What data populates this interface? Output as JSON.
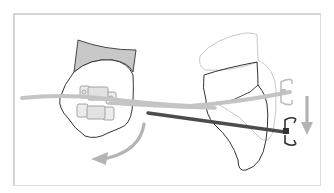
{
  "figure": {
    "panels": [
      {
        "name": "front-view",
        "elements": [
          "tooth-crown",
          "gingiva-band",
          "bracket",
          "archwire",
          "rotation-arrow"
        ]
      },
      {
        "name": "side-view",
        "elements": [
          "tooth-original-outline",
          "tooth-moved-outline",
          "wire-light",
          "wire-dark",
          "bracket-hook-light",
          "bracket-hook-dark",
          "down-arrow"
        ]
      }
    ],
    "colors": {
      "frame": "#d3d3d3",
      "outline": "#333333",
      "gingiva": "#c8c8c8",
      "wire_light": "#c4c4c4",
      "wire_dark": "#555555",
      "ghost_outline": "#c8c8c8",
      "arrow": "#b4b4b4",
      "bracket_fill": "#e6e6e6",
      "bracket_stroke": "#9a9a9a"
    }
  }
}
